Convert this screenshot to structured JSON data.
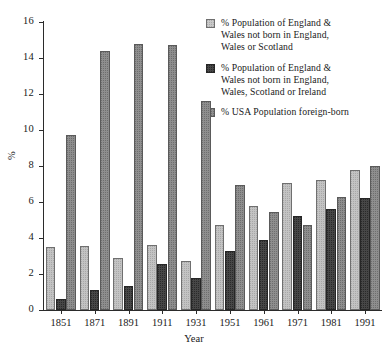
{
  "chart_data": {
    "type": "bar",
    "title": "",
    "xlabel": "Year",
    "ylabel": "%",
    "categories": [
      "1851",
      "1871",
      "1891",
      "1911",
      "1931",
      "1951",
      "1961",
      "1971",
      "1981",
      "1991"
    ],
    "series": [
      {
        "name": "% Population of England & Wales not born in England, Wales or Scotland",
        "color": "#c3c3c3",
        "values": [
          3.5,
          3.55,
          2.9,
          3.6,
          2.75,
          4.75,
          5.8,
          7.05,
          7.2,
          7.8
        ]
      },
      {
        "name": "% Population of England & Wales not born in England, Wales, Scotland or Ireland",
        "color": "#474747",
        "values": [
          0.6,
          1.1,
          1.35,
          2.55,
          1.8,
          3.3,
          3.9,
          5.25,
          5.6,
          6.2
        ]
      },
      {
        "name": "% USA Population foreign-born",
        "color": "#8e8e8e",
        "values": [
          9.7,
          14.4,
          14.8,
          14.7,
          11.6,
          6.95,
          5.45,
          4.75,
          6.3,
          8.0
        ]
      }
    ],
    "ylim": [
      0,
      16
    ],
    "yticks": [
      0,
      2,
      4,
      6,
      8,
      10,
      12,
      14,
      16
    ],
    "ytick_labels": [
      "0",
      "2",
      "4",
      "6",
      "8",
      "10",
      "12",
      "14",
      "16"
    ],
    "grid": false,
    "legend_position": "top-right"
  },
  "legend": {
    "entries": [
      {
        "label_lines": [
          "% Population of England &",
          "Wales not born in England,",
          "Wales or Scotland"
        ]
      },
      {
        "label_lines": [
          "% Population of England &",
          "Wales not born in England,",
          "Wales, Scotland or Ireland"
        ]
      },
      {
        "label_lines": [
          "% USA Population foreign-born"
        ]
      }
    ]
  }
}
